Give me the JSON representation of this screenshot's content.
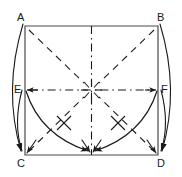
{
  "figure": {
    "type": "geometry-fold-diagram",
    "background_color": "#ffffff",
    "stroke_color": "#1a1a1a",
    "canvas": {
      "width": 182,
      "height": 177
    }
  },
  "labels": {
    "a": "A",
    "b": "B",
    "c": "C",
    "d": "D",
    "e": "E",
    "f": "F"
  },
  "label_positions": {
    "a": {
      "x": 17,
      "y": 12
    },
    "b": {
      "x": 157,
      "y": 12
    },
    "c": {
      "x": 17,
      "y": 158
    },
    "d": {
      "x": 157,
      "y": 158
    },
    "e": {
      "x": 15,
      "y": 84
    },
    "f": {
      "x": 161,
      "y": 84
    }
  },
  "points": {
    "a": {
      "x": 25,
      "y": 26
    },
    "b": {
      "x": 158,
      "y": 26
    },
    "c": {
      "x": 25,
      "y": 155
    },
    "d": {
      "x": 158,
      "y": 155
    },
    "e": {
      "x": 25,
      "y": 90
    },
    "f": {
      "x": 158,
      "y": 90
    },
    "center": {
      "x": 91.5,
      "y": 90
    },
    "top_mid": {
      "x": 91.5,
      "y": 26
    },
    "bottom_mid": {
      "x": 91.5,
      "y": 155
    }
  },
  "square": {
    "name": "ABCD",
    "path": "M25,26 L158,26 L158,155 L25,155 Z",
    "style": "solid"
  },
  "creases": [
    {
      "name": "diagonal-a-center",
      "style": "dashed",
      "path": "M28,29 L88,87"
    },
    {
      "name": "diagonal-b-center",
      "style": "dashed",
      "path": "M155,29 L95,87"
    },
    {
      "name": "diagonal-c-center",
      "style": "dashed",
      "path": "M28,152 L88,93"
    },
    {
      "name": "diagonal-d-center",
      "style": "dashed",
      "path": "M155,152 L95,93"
    },
    {
      "name": "vertical-midline",
      "style": "dash-dot",
      "path": "M91.5,26 L91.5,155"
    },
    {
      "name": "horizontal-midline",
      "style": "dash-dot",
      "path": "M25,90 L158,90"
    }
  ],
  "arcs": [
    {
      "name": "arc-e-to-bottom-mid",
      "path": "M25,90 Q42,140 90,153",
      "tick": true
    },
    {
      "name": "arc-f-to-bottom-mid",
      "path": "M158,90 Q141,140 93,153",
      "tick": true
    },
    {
      "name": "arc-a-to-c-outer",
      "path": "M22,24 Q4,90 20,152"
    },
    {
      "name": "arc-e-to-c-outer",
      "path": "M22,90 Q14,124 21,152"
    },
    {
      "name": "arc-b-to-d-outer",
      "path": "M161,24 Q179,90 163,152"
    },
    {
      "name": "arc-f-to-d-outer",
      "path": "M161,90 Q169,124 162,152"
    }
  ],
  "arrow_targets": [
    {
      "name": "arrowhead-at-c",
      "x": 25,
      "y": 155,
      "count": 2
    },
    {
      "name": "arrowhead-at-d",
      "x": 158,
      "y": 155,
      "count": 2
    },
    {
      "name": "arrowhead-at-bottom-mid",
      "x": 91.5,
      "y": 155,
      "count": 2
    },
    {
      "name": "arrowhead-at-e",
      "x": 25,
      "y": 90,
      "count": 1
    },
    {
      "name": "arrowhead-at-f",
      "x": 158,
      "y": 90,
      "count": 1
    }
  ],
  "center_star": {
    "name": "center-crease-star",
    "ray_count": 8,
    "radius": 13
  }
}
